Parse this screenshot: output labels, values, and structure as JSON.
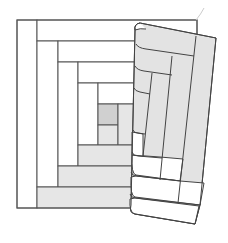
{
  "figure": {
    "title": "Log cabin quilt block with folded corner",
    "colors": {
      "background": "#ffffff",
      "outline": "#555555",
      "white_fabric": "#ffffff",
      "light_fabric": "#e6e6e6",
      "center_fabric": "#d0d0d0",
      "flap_fabric": "#e3e3e3"
    },
    "block": {
      "frame": [
        17,
        20,
        180,
        188
      ],
      "light_logs": [
        {
          "x": 17,
          "y": 20,
          "w": 20,
          "h": 188
        },
        {
          "x": 37,
          "y": 20,
          "w": 160,
          "h": 21
        },
        {
          "x": 37,
          "y": 41,
          "w": 21,
          "h": 146
        },
        {
          "x": 58,
          "y": 41,
          "w": 139,
          "h": 21
        },
        {
          "x": 58,
          "y": 62,
          "w": 20,
          "h": 104
        },
        {
          "x": 78,
          "y": 62,
          "w": 119,
          "h": 21
        },
        {
          "x": 78,
          "y": 83,
          "w": 20,
          "h": 62
        },
        {
          "x": 98,
          "y": 83,
          "w": 99,
          "h": 21
        }
      ],
      "center_square": {
        "x": 98,
        "y": 104,
        "w": 20,
        "h": 21
      },
      "dark_logs": [
        {
          "x": 98,
          "y": 125,
          "w": 20,
          "h": 20
        },
        {
          "x": 118,
          "y": 104,
          "w": 20,
          "h": 41
        },
        {
          "x": 78,
          "y": 145,
          "w": 119,
          "h": 21
        },
        {
          "x": 58,
          "y": 166,
          "w": 139,
          "h": 21
        },
        {
          "x": 37,
          "y": 187,
          "w": 160,
          "h": 21
        }
      ]
    },
    "flap": {
      "description": "Folded back corner showing reverse side of block"
    }
  }
}
